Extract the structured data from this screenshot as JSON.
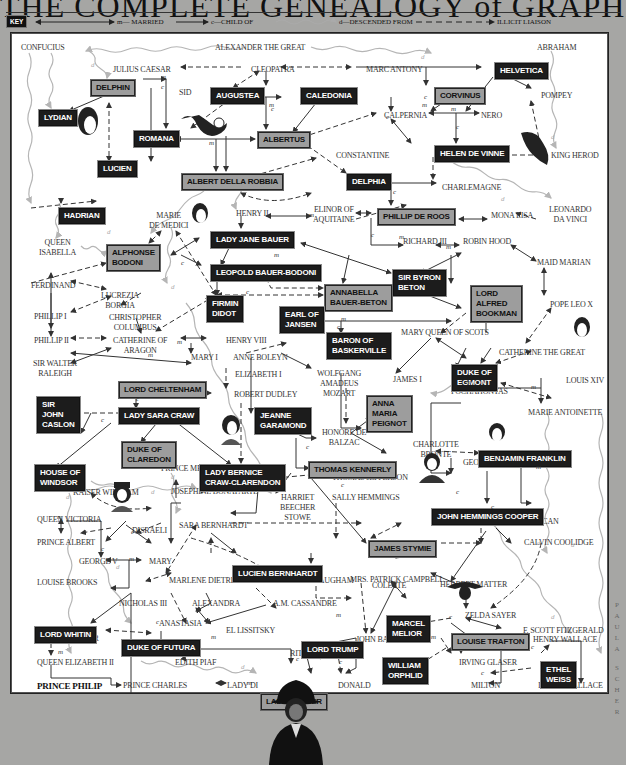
{
  "title": "THE COMPLETE GENEALOGY of GRAPHIC DESIGN",
  "key": {
    "label": "KEY",
    "married": "m— MARRIED",
    "child_of": "c—CHILD OF",
    "descended_from": "d—DESCENDED FROM",
    "illicit": "ILLICIT LIAISON"
  },
  "credit": "PAULA SCHER",
  "names": {
    "confucius": "CONFUCIUS",
    "alexander": "ALEXANDER THE GREAT",
    "abraham": "ABRAHAM",
    "julius": "JULIUS CAESAR",
    "cleopatra": "CLEOPATRA",
    "marc": "MARC ANTONY",
    "sid": "SID",
    "calpernia": "CALPERNIA",
    "nero": "NERO",
    "pompey": "POMPEY",
    "constantine": "CONSTANTINE",
    "king_herod": "KING HEROD",
    "charlemagne": "CHARLEMAGNE",
    "henry2": "HENRY II",
    "elinor": "ELINOR OF\nAQUITAINE",
    "marie_medici": "MARIE\nDE MEDICI",
    "mona": "MONA LISA",
    "leonardo": "LEONARDO\nDA VINCI",
    "queen_isabella": "QUEEN\nISABELLA",
    "richard3": "RICHARD III",
    "robin": "ROBIN HOOD",
    "maid_marian": "MAID MARIAN",
    "ferdinand": "FERDINAND",
    "lucrezia": "LUCREZIA\nBORGIA",
    "pope_leo": "POPE LEO X",
    "phillip1": "PHILLIP I",
    "columbus": "CHRISTOPHER\nCOLUMBUS",
    "mary_scots": "MARY QUEEN OF SCOTS",
    "phillip2": "PHILLIP II",
    "catherine_aragon": "CATHERINE OF\nARAGON",
    "henry8": "HENRY VIII",
    "catherine_great": "CATHERINE THE GREAT",
    "raleigh": "SIR WALTER\nRALEIGH",
    "mary1": "MARY I",
    "anne_boleyn": "ANNE BOLEYN",
    "james1": "JAMES I",
    "elizabeth1": "ELIZABETH I",
    "mozart": "WOLFGANG\nAMADEUS\nMOZART",
    "robert_dudley": "ROBERT DUDLEY",
    "pochahontas": "POCHAHONTAS",
    "louis14": "LOUIS XIV",
    "balzac": "HONORE DE\nBALZAC",
    "marie_antoinette": "MARIE ANTOINETTE",
    "charlotte": "CHARLOTTE\nBRONTE",
    "prince_metternich": "PRINCE METTERNICH",
    "george_sand": "GEORGE SAND",
    "chopin": "CHOPIN",
    "thomas_jefferson": "THOMAS JEFFERSON",
    "kaiser": "KAISER WILHELM",
    "josephine": "JOSEPHINE BONAPARTE",
    "harriet": "HARRIET\nBEECHER\nSTOWE",
    "sally": "SALLY HEMMINGS",
    "queen_victoria": "QUEEN VICTORIA",
    "disraeli": "DISRAELI",
    "sara_bernhardt": "SARA BERNHARDT",
    "isadora": "ISADORA DUNCAN",
    "prince_albert": "PRINCE ALBERT",
    "calvin": "CALVIN COOLIDGE",
    "george5": "GEORGE V",
    "mary": "MARY",
    "mrs_campbell": "MRS. PATRICK CAMPBELL",
    "louise_brooks": "LOUISE BROOKS",
    "marlene": "MARLENE DIETRICH",
    "somerset": "SOMERSET MAUGHAM",
    "colette": "COLETTE",
    "herbert_matter": "HERBERT MATTER",
    "nicholas3": "NICHOLAS III",
    "alexandra": "ALEXANDRA",
    "cassandre": "A.M. CASSANDRE",
    "zelda": "ZELDA SAYER",
    "anastasia": "ANASTASIA",
    "lissitsky": "EL LISSITSKY",
    "fitzgerald": "F. SCOTT FITZGERALD",
    "herbert_bayer": "HERBERT BAYER",
    "john_barrymore": "JOHN BARRYMORE",
    "henry_wallace": "HENRY WALLACE",
    "rita": "RITA HAYWORTH",
    "queen_elizabeth2": "QUEEN ELIZABETH II",
    "edith": "EDITH PIAF",
    "irving_glaser": "IRVING GLASER",
    "prince_philip": "PRINCE PHILIP",
    "prince_charles": "PRINCE CHARLES",
    "lady_di": "LADY DI",
    "donald": "DONALD",
    "milton": "MILTON",
    "irving_wallace": "IRVING WALLACE"
  },
  "designers": {
    "helvetica": "HELVETICA",
    "delphin": "DELPHIN",
    "augustea": "AUGUSTEA",
    "caledonia": "CALEDONIA",
    "corvinus": "CORVINUS",
    "lydian": "LYDIAN",
    "romana": "ROMANA",
    "albertus": "ALBERTUS",
    "helen": "HELEN DE VINNE",
    "lucien": "LUCIEN",
    "albert_della": "ALBERT DELLA ROBBIA",
    "delphia": "DELPHIA",
    "hadrian": "HADRIAN",
    "phillip_roos": "PHILLIP DE ROOS",
    "lady_jane": "LADY JANE BAUER",
    "alphonse": "ALPHONSE\nBODONI",
    "leopold": "LEOPOLD BAUER-BODONI",
    "sir_byron": "SIR BYRON\nBETON",
    "annabella": "ANNABELLA\nBAUER-BETON",
    "lord_alfred": "LORD\nALFRED\nBOOKMAN",
    "firmin": "FIRMIN\nDIDOT",
    "earl_jansen": "EARL OF\nJANSEN",
    "baron": "BARON OF\nBASKERVILLE",
    "duke_egmont": "DUKE OF\nEGMONT",
    "lord_cheltenham": "LORD CHELTENHAM",
    "sir_john": "SIR\nJOHN\nCASLON",
    "lady_sara": "LADY SARA CRAW",
    "jeanne": "JEANNE\nGARAMOND",
    "anna_maria": "ANNA\nMARIA\nPEIGNOT",
    "duke_claredon": "DUKE OF\nCLAREDON",
    "benjamin": "BENJAMIN FRANKLIN",
    "thomas_kennerly": "THOMAS KENNERLY",
    "house_windsor": "HOUSE OF\nWINDSOR",
    "lady_bernice": "LADY BERNICE\nCRAW-CLARENDON",
    "john_hemmings": "JOHN HEMMINGS COOPER",
    "james_stymie": "JAMES STYMIE",
    "lucien_bernhardt": "LUCIEN BERNHARDT",
    "lord_whitin": "LORD WHITIN",
    "marcel": "MARCEL\nMELIOR",
    "lord_trump": "LORD TRUMP",
    "duke_futura": "DUKE OF FUTURA",
    "louise_trafton": "LOUISE TRAFTON",
    "william": "WILLIAM\nORPHLID",
    "ethel": "ETHEL\nWEISS",
    "lady_bulmer": "LADY BULMER"
  },
  "marks": {
    "married": "m",
    "child": "c",
    "descended": "d"
  },
  "colors": {
    "background": "#a6a6a4",
    "panel": "#ffffff",
    "dark_box": "#1c1c1c",
    "gray_box": "#9d9d9d",
    "line": "#333333",
    "descent_line": "#b5b5b5"
  }
}
